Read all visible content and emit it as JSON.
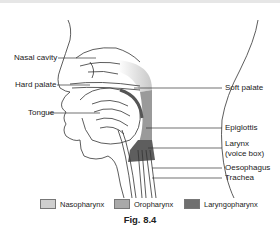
{
  "figure": {
    "caption": "Fig. 8.4",
    "labels": {
      "nasal_cavity": "Nasal cavity",
      "hard_palate": "Hard palate",
      "tongue": "Tongue",
      "soft_palate": "Soft palate",
      "epiglottis": "Epiglottis",
      "larynx_line1": "Larynx",
      "larynx_line2": "(voice box)",
      "oesophagus": "Oesophagus",
      "trachea": "Trachea"
    },
    "legend": [
      {
        "label": "Nasopharynx",
        "color": "#cfcfcf"
      },
      {
        "label": "Oropharynx",
        "color": "#a9a9a9"
      },
      {
        "label": "Laryngopharynx",
        "color": "#6f6f6f"
      }
    ]
  }
}
